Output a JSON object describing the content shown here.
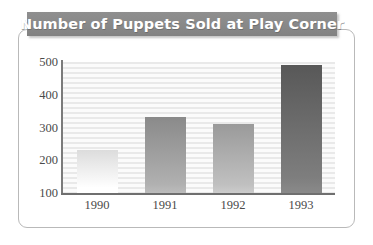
{
  "chart_data": {
    "type": "bar",
    "title": "Number of Puppets Sold at Play Corner",
    "xlabel": "",
    "ylabel": "",
    "categories": [
      "1990",
      "1991",
      "1992",
      "1993"
    ],
    "values": [
      230,
      332,
      310,
      490
    ],
    "ylim": [
      100,
      500
    ],
    "yticks": [
      "100",
      "200",
      "300",
      "400",
      "500"
    ],
    "ytick_values": [
      100,
      200,
      300,
      400,
      500
    ],
    "grid": true,
    "grid_orientation": "horizontal",
    "legend": false,
    "bar_colors": [
      "#dcdcdc",
      "#8a8a8a",
      "#9a9a9a",
      "#585858"
    ],
    "plot_background": "#ececec",
    "title_background": "#8a8a8a",
    "title_color": "#ffffff",
    "axis_color": "#6f6f6f",
    "tick_label_color": "#4a4a4a"
  },
  "figure": {
    "title": "Number of Puppets Sold at Play Corner"
  }
}
